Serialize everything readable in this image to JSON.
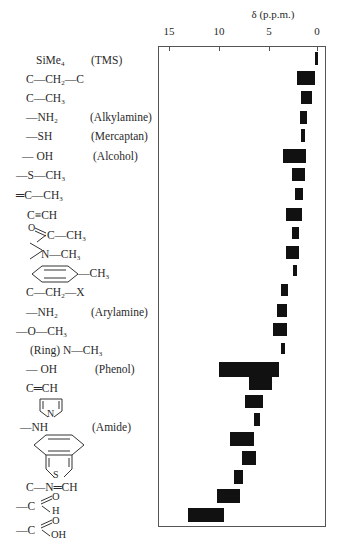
{
  "chart_data": {
    "type": "bar",
    "orientation": "horizontal-range",
    "title": "",
    "xlabel": "δ (p.p.m.)",
    "ylabel": "",
    "xlim": [
      16,
      0
    ],
    "x_reversed": true,
    "xticks": [
      15,
      10,
      5,
      0
    ],
    "grid": false,
    "legend": null,
    "categories": [
      "SiMe4 (TMS)",
      "C—CH2—C",
      "C—CH3",
      "—NH2 (Alkylamine)",
      "—SH (Mercaptan)",
      "—OH (Alcohol)",
      "—S—CH3",
      "=C—CH3",
      "C≡CH",
      "O=C—CH3",
      ">N—CH3",
      "Aryl—CH3",
      "C—CH2—X",
      "—NH2 (Arylamine)",
      "—O—CH3",
      "(Ring) N—CH3",
      "—OH (Phenol)",
      "C=CH",
      "Pyrrole",
      "—NH (Amide)",
      "Benzothiophene (benzo ring)",
      "Benzothiophene (thiophene ring)",
      "C—N=CH",
      "—CHO (Aldehyde)",
      "—COOH (Carboxylic acid)"
    ],
    "ranges": [
      [
        0.0,
        0.2
      ],
      [
        0.2,
        2.0
      ],
      [
        0.5,
        1.6
      ],
      [
        1.0,
        1.7
      ],
      [
        1.2,
        1.6
      ],
      [
        1.1,
        3.4
      ],
      [
        1.2,
        2.5
      ],
      [
        1.4,
        2.2
      ],
      [
        1.5,
        3.1
      ],
      [
        1.8,
        2.5
      ],
      [
        1.8,
        3.1
      ],
      [
        2.0,
        2.4
      ],
      [
        2.9,
        3.6
      ],
      [
        3.0,
        4.0
      ],
      [
        3.0,
        4.4
      ],
      [
        3.2,
        3.6
      ],
      [
        3.8,
        9.8
      ],
      [
        4.5,
        6.8
      ],
      [
        5.4,
        7.2
      ],
      [
        5.7,
        6.3
      ],
      [
        6.3,
        8.7
      ],
      [
        6.1,
        7.5
      ],
      [
        7.4,
        8.3
      ],
      [
        7.7,
        10.0
      ],
      [
        9.3,
        12.9
      ]
    ]
  },
  "axis": {
    "title": "δ (p.p.m.)",
    "ticks": [
      "15",
      "10",
      "5",
      "0"
    ]
  },
  "labels": {
    "tms": {
      "formula": "SiMe",
      "sub": "4",
      "note": "(TMS)"
    },
    "ch2": {
      "a": "C—CH",
      "sub": "2",
      "b": "—C"
    },
    "ch3": {
      "a": "C—CH",
      "sub": "3"
    },
    "nh2_alkyl": {
      "a": "—NH",
      "sub": "2",
      "note": "(Alkylamine)"
    },
    "sh": {
      "a": "—SH",
      "note": "(Mercaptan)"
    },
    "oh_alc": {
      "a": "— OH",
      "note": "(Alcohol)"
    },
    "sch3": {
      "a": "—S—CH",
      "sub": "3"
    },
    "vinyl_ch3": {
      "a": "═C—CH",
      "sub": "3"
    },
    "alkyne": {
      "a": "C≡CH"
    },
    "acetyl": {
      "o": "O",
      "a": "C—CH",
      "sub": "3"
    },
    "nch3": {
      "a": "N—CH",
      "sub": "3"
    },
    "arch3": {
      "a": "—CH",
      "sub": "3"
    },
    "ch2x": {
      "a": "C—CH",
      "sub": "2",
      "b": "—X"
    },
    "nh2_aryl": {
      "a": "—NH",
      "sub": "2",
      "note": "(Arylamine)"
    },
    "och3": {
      "a": "—O—CH",
      "sub": "3"
    },
    "ring_nch3": {
      "a": "(Ring) N—CH",
      "sub": "3"
    },
    "oh_phenol": {
      "a": "— OH",
      "note": "(Phenol)"
    },
    "alkene": {
      "a": "C═CH"
    },
    "pyrrole": {
      "n": "N"
    },
    "amide": {
      "a": "—NH",
      "note": "(Amide)"
    },
    "benzothiophene": {
      "s": "S"
    },
    "imine": {
      "a": "C—N═CH"
    },
    "aldehyde": {
      "a": "—C",
      "o": "O",
      "h": "H"
    },
    "acid": {
      "a": "—C",
      "o": "O",
      "oh": "OH"
    }
  },
  "colors": {
    "bar": "#111111",
    "frame": "#555555",
    "text": "#2a2a2a"
  }
}
